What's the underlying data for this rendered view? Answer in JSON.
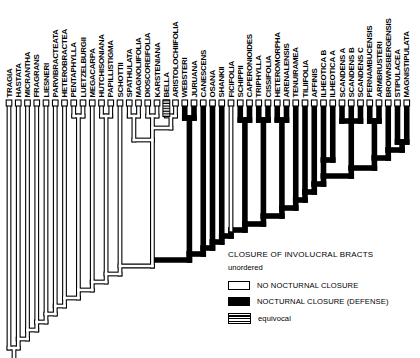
{
  "figure": {
    "kind": "cladogram-figure",
    "legend": {
      "title": "CLOSURE OF INVOLUCRAL BRACTS",
      "subtitle": "unordered",
      "items": [
        {
          "label": "NO NOCTURNAL CLOSURE",
          "style": "open",
          "color": "#ffffff"
        },
        {
          "label": "NOCTURNAL CLOSURE (DEFENSE)",
          "style": "filled",
          "color": "#000000"
        },
        {
          "label": "equivocal",
          "style": "hatched"
        }
      ]
    }
  },
  "chart_data": {
    "type": "cladogram",
    "character": "CLOSURE OF INVOLUCRAL BRACTS (unordered)",
    "states": {
      "open": "NO NOCTURNAL CLOSURE",
      "black": "NOCTURNAL CLOSURE (DEFENSE)",
      "hatch": "equivocal"
    },
    "taxa": [
      {
        "name": "TRAGIA",
        "state": "open"
      },
      {
        "name": "HASTATA",
        "state": "open"
      },
      {
        "name": "MICRANTHA",
        "state": "open"
      },
      {
        "name": "FRAGRANS",
        "state": "open"
      },
      {
        "name": "LIESNERI",
        "state": "open"
      },
      {
        "name": "PARVIBRACTEATA",
        "state": "open"
      },
      {
        "name": "HETEROBRACTEA",
        "state": "open"
      },
      {
        "name": "PENTAPHYLLA",
        "state": "open"
      },
      {
        "name": "LUETZELBURGII",
        "state": "open"
      },
      {
        "name": "MEGACARPA",
        "state": "open"
      },
      {
        "name": "HUTCHISONIANA",
        "state": "open"
      },
      {
        "name": "PAPILLISTIGMA",
        "state": "open"
      },
      {
        "name": "SCHOTTII",
        "state": "open"
      },
      {
        "name": "SPATHULATA",
        "state": "open"
      },
      {
        "name": "MAGNOLIIFOLIA",
        "state": "open"
      },
      {
        "name": "DIOSCOREIFOLIA",
        "state": "open"
      },
      {
        "name": "KARSTENIANA",
        "state": "open"
      },
      {
        "name": "BELLA",
        "state": "hatch"
      },
      {
        "name": "ARISTOLOCHIIFOLIA",
        "state": "open"
      },
      {
        "name": "WEBSTERI",
        "state": "black"
      },
      {
        "name": "JURUANA",
        "state": "black"
      },
      {
        "name": "CANESCENS",
        "state": "black"
      },
      {
        "name": "OSANA",
        "state": "black"
      },
      {
        "name": "SHANKII",
        "state": "black"
      },
      {
        "name": "FICIFOLIA",
        "state": "open"
      },
      {
        "name": "SCHIPPII",
        "state": "black"
      },
      {
        "name": "CAPERONIOIDES",
        "state": "black"
      },
      {
        "name": "TRIPHYLLA",
        "state": "black"
      },
      {
        "name": "CISSIFOLIA",
        "state": "black"
      },
      {
        "name": "HETEROMORPHA",
        "state": "black"
      },
      {
        "name": "ARENALENSIS",
        "state": "black"
      },
      {
        "name": "TENUIRAMEA",
        "state": "black"
      },
      {
        "name": "TILIIFOLIA",
        "state": "black"
      },
      {
        "name": "AFFINIS",
        "state": "black"
      },
      {
        "name": "ILHEOTICA B",
        "state": "black"
      },
      {
        "name": "ILHEOTICA A",
        "state": "black"
      },
      {
        "name": "SCANDENS A",
        "state": "black"
      },
      {
        "name": "SCANDENS B",
        "state": "black"
      },
      {
        "name": "SCANDENS C",
        "state": "black"
      },
      {
        "name": "PERNAMBUCENSIS",
        "state": "black"
      },
      {
        "name": "ARMBRUSTERI",
        "state": "black"
      },
      {
        "name": "BROWNSBERGENSIS",
        "state": "black"
      },
      {
        "name": "STIPULACEA",
        "state": "black"
      },
      {
        "name": "MAGNISTIPULATA",
        "state": "black"
      }
    ],
    "topology_newick": "(TRAGIA,(HASTATA,(MICRANTHA,(FRAGRANS,(LIESNERI,(PARVIBRACTEATA,(HETEROBRACTEA,((PENTAPHYLLA,LUETZELBURGII),(MEGACARPA,((HUTCHISONIANA,PAPILLISTIGMA),(SCHOTTII,(((SPATHULATA,MAGNOLIIFOLIA),((DIOSCOREIFOLIA,KARSTENIANA),(BELLA,ARISTOLOCHIIFOLIA))),((WEBSTERI,JURUANA),(CANESCENS,(OSANA,(SHANKII,(FICIFOLIA,((SCHIPPII,CAPERONIOIDES),((TRIPHYLLA,CISSIFOLIA),((HETEROMORPHA,ARENALENSIS),(TENUIRAMEA,(TILIIFOLIA,(AFFINIS,((ILHEOTICA_B,ILHEOTICA_A),((SCANDENS_A,SCANDENS_B,SCANDENS_C),((PERNAMBUCENSIS,ARMBRUSTERI),(BROWNSBERGENSIS,(STIPULACEA,MAGNISTIPULATA))))))))))))))))))))))))))",
    "layout": {
      "svg_w": 420,
      "svg_h": 358,
      "tip_x_start": 9,
      "tip_spacing": 9.25,
      "tip_box_top": 100,
      "tip_box_h": 6,
      "tip_box_w": 5.6,
      "label_baseline_y": 97.5,
      "stroke_black": 5.6,
      "stroke_open_outer": 4.8,
      "stroke_open_inner": 2.6,
      "hatch_rect": {
        "x": 162.9,
        "y": 100,
        "w": 6.9,
        "h": 16.5
      },
      "open_segments": [
        [
          9,
          106,
          9,
          348
        ],
        [
          18.25,
          106,
          18.25,
          339
        ],
        [
          27.5,
          106,
          27.5,
          330
        ],
        [
          36.75,
          106,
          36.75,
          322
        ],
        [
          46,
          106,
          46,
          314
        ],
        [
          55.25,
          106,
          55.25,
          306
        ],
        [
          64.5,
          106,
          64.5,
          298
        ],
        [
          73.75,
          106,
          73.75,
          116
        ],
        [
          83,
          106,
          83,
          116
        ],
        [
          73.75,
          116,
          83,
          116
        ],
        [
          78.4,
          116,
          78.4,
          290
        ],
        [
          92.25,
          106,
          92.25,
          282
        ],
        [
          101.5,
          106,
          101.5,
          116
        ],
        [
          110.75,
          106,
          110.75,
          116
        ],
        [
          101.5,
          116,
          110.75,
          116
        ],
        [
          106.1,
          116,
          106.1,
          274
        ],
        [
          120,
          106,
          120,
          274
        ],
        [
          129.25,
          106,
          129.25,
          116
        ],
        [
          138.5,
          106,
          138.5,
          116
        ],
        [
          129.25,
          116,
          138.5,
          116
        ],
        [
          133.9,
          116,
          133.9,
          140
        ],
        [
          147.75,
          106,
          147.75,
          116
        ],
        [
          157,
          106,
          157,
          116
        ],
        [
          147.75,
          116,
          157,
          116
        ],
        [
          152.4,
          116,
          152.4,
          128
        ],
        [
          175.5,
          106,
          175.5,
          116
        ],
        [
          166.25,
          116,
          175.5,
          116
        ],
        [
          170.9,
          116,
          170.9,
          128
        ],
        [
          152.4,
          128,
          170.9,
          128
        ],
        [
          152.4,
          128,
          152.4,
          266
        ],
        [
          133.9,
          140,
          152.4,
          140
        ],
        [
          120,
          266,
          152.4,
          266
        ],
        [
          106.1,
          274,
          120,
          274
        ],
        [
          106.1,
          274,
          106.1,
          282
        ],
        [
          92.25,
          282,
          106.1,
          282
        ],
        [
          92.25,
          282,
          92.25,
          290
        ],
        [
          78.4,
          290,
          92.25,
          290
        ],
        [
          78.4,
          290,
          78.4,
          298
        ],
        [
          64.5,
          298,
          78.4,
          298
        ],
        [
          64.5,
          298,
          64.5,
          306
        ],
        [
          55.25,
          306,
          64.5,
          306
        ],
        [
          55.25,
          306,
          55.25,
          314
        ],
        [
          46,
          314,
          55.25,
          314
        ],
        [
          46,
          314,
          46,
          322
        ],
        [
          36.75,
          322,
          46,
          322
        ],
        [
          36.75,
          322,
          36.75,
          330
        ],
        [
          27.5,
          330,
          36.75,
          330
        ],
        [
          27.5,
          330,
          27.5,
          339
        ],
        [
          18.25,
          339,
          27.5,
          339
        ],
        [
          18.25,
          339,
          18.25,
          348
        ],
        [
          9,
          348,
          18.25,
          348
        ],
        [
          14,
          348,
          14,
          357
        ],
        [
          231,
          106,
          231,
          230
        ]
      ],
      "black_segments": [
        [
          184.75,
          106,
          184.75,
          118
        ],
        [
          194,
          106,
          194,
          118
        ],
        [
          184.75,
          118,
          194,
          118
        ],
        [
          189.4,
          118,
          189.4,
          254
        ],
        [
          189.4,
          254,
          203.25,
          254
        ],
        [
          189.4,
          254,
          189.4,
          260
        ],
        [
          155,
          260,
          189.4,
          260
        ],
        [
          203.25,
          106,
          203.25,
          248
        ],
        [
          203.25,
          248,
          212.5,
          248
        ],
        [
          203.25,
          248,
          203.25,
          254
        ],
        [
          212.5,
          106,
          212.5,
          242
        ],
        [
          212.5,
          242,
          221.75,
          242
        ],
        [
          212.5,
          242,
          212.5,
          248
        ],
        [
          221.75,
          106,
          221.75,
          236
        ],
        [
          221.75,
          236,
          231,
          236
        ],
        [
          221.75,
          236,
          221.75,
          242
        ],
        [
          231,
          230,
          244.9,
          230
        ],
        [
          231,
          230,
          231,
          236
        ],
        [
          240.25,
          106,
          240.25,
          120
        ],
        [
          249.5,
          106,
          249.5,
          120
        ],
        [
          240.25,
          120,
          249.5,
          120
        ],
        [
          244.9,
          120,
          244.9,
          224
        ],
        [
          244.9,
          224,
          263.4,
          224
        ],
        [
          244.9,
          224,
          244.9,
          230
        ],
        [
          258.75,
          106,
          258.75,
          120
        ],
        [
          268,
          106,
          268,
          120
        ],
        [
          258.75,
          120,
          268,
          120
        ],
        [
          263.4,
          120,
          263.4,
          216
        ],
        [
          263.4,
          216,
          281.9,
          216
        ],
        [
          263.4,
          216,
          263.4,
          224
        ],
        [
          277.25,
          106,
          277.25,
          120
        ],
        [
          286.5,
          106,
          286.5,
          120
        ],
        [
          277.25,
          120,
          286.5,
          120
        ],
        [
          281.9,
          120,
          281.9,
          208
        ],
        [
          281.9,
          208,
          295.75,
          208
        ],
        [
          281.9,
          208,
          281.9,
          216
        ],
        [
          295.75,
          106,
          295.75,
          200
        ],
        [
          295.75,
          200,
          305,
          200
        ],
        [
          295.75,
          200,
          295.75,
          208
        ],
        [
          305,
          106,
          305,
          192
        ],
        [
          305,
          192,
          314.25,
          192
        ],
        [
          305,
          192,
          305,
          200
        ],
        [
          314.25,
          106,
          314.25,
          184
        ],
        [
          314.25,
          184,
          323.5,
          184
        ],
        [
          314.25,
          184,
          314.25,
          192
        ],
        [
          323.5,
          106,
          323.5,
          160
        ],
        [
          332.75,
          106,
          332.75,
          160
        ],
        [
          323.5,
          160,
          332.75,
          160
        ],
        [
          323.5,
          160,
          323.5,
          176
        ],
        [
          342,
          106,
          342,
          121
        ],
        [
          351.25,
          106,
          351.25,
          121
        ],
        [
          360.5,
          106,
          360.5,
          121
        ],
        [
          342,
          121,
          360.5,
          121
        ],
        [
          351.25,
          121,
          351.25,
          168
        ],
        [
          369.75,
          106,
          369.75,
          121
        ],
        [
          379,
          106,
          379,
          121
        ],
        [
          369.75,
          121,
          379,
          121
        ],
        [
          374.4,
          121,
          374.4,
          158
        ],
        [
          397.5,
          106,
          397.5,
          142
        ],
        [
          406.75,
          106,
          406.75,
          142
        ],
        [
          397.5,
          142,
          406.75,
          142
        ],
        [
          402.1,
          142,
          402.1,
          150
        ],
        [
          388.25,
          106,
          388.25,
          150
        ],
        [
          388.25,
          150,
          402.1,
          150
        ],
        [
          388.25,
          150,
          388.25,
          158
        ],
        [
          374.4,
          158,
          388.25,
          158
        ],
        [
          374.4,
          158,
          374.4,
          168
        ],
        [
          351.25,
          168,
          374.4,
          168
        ],
        [
          351.25,
          168,
          351.25,
          176
        ],
        [
          323.5,
          176,
          351.25,
          176
        ],
        [
          323.5,
          176,
          323.5,
          184
        ]
      ]
    }
  }
}
